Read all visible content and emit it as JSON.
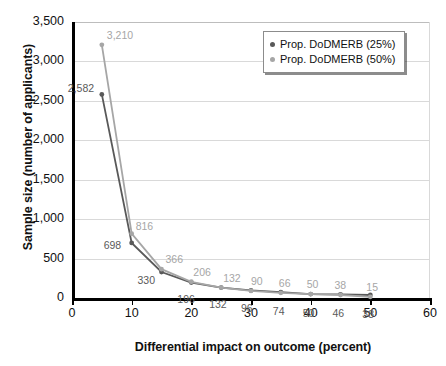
{
  "chart_data": {
    "type": "line",
    "title": "",
    "xlabel": "Differential impact on outcome (percent)",
    "ylabel": "Sample size (number of applicants)",
    "xlim": [
      0,
      60
    ],
    "ylim": [
      0,
      3500
    ],
    "xticks": [
      "0",
      "10",
      "20",
      "30",
      "40",
      "50",
      "60"
    ],
    "yticks": [
      "0",
      "500",
      "1,000",
      "1,500",
      "2,000",
      "2,500",
      "3,000",
      "3,500"
    ],
    "grid": "horizontal",
    "legend_position": "top-right",
    "x": [
      5,
      10,
      15,
      20,
      25,
      30,
      35,
      40,
      45,
      50
    ],
    "series": [
      {
        "name": "Prop. DoDMERB (25%)",
        "color": "#595959",
        "values": [
          2582,
          698,
          330,
          196,
          132,
          96,
          74,
          50,
          46,
          38
        ],
        "labels": [
          "2,582",
          "698",
          "330",
          "196",
          "132",
          "96",
          "74",
          "50",
          "46",
          "38"
        ]
      },
      {
        "name": "Prop. DoDMERB (50%)",
        "color": "#a6a6a6",
        "values": [
          3210,
          816,
          366,
          206,
          132,
          90,
          66,
          50,
          38,
          15
        ],
        "labels": [
          "3,210",
          "816",
          "366",
          "206",
          "132",
          "90",
          "66",
          "50",
          "38",
          "15"
        ]
      }
    ]
  },
  "legend": {
    "items": [
      {
        "label": "Prop. DoDMERB (25%)",
        "color": "#595959"
      },
      {
        "label": "Prop. DoDMERB (50%)",
        "color": "#a6a6a6"
      }
    ]
  }
}
